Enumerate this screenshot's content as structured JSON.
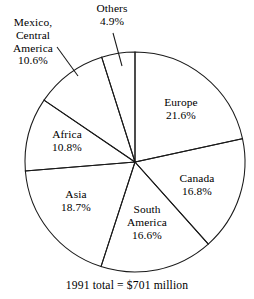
{
  "chart_data": {
    "type": "pie",
    "title": "",
    "subtitle": "",
    "caption": "1991 total = $701 million",
    "total_label": "1991 total",
    "total_value": "$701 million",
    "year": "1991",
    "units": "percent of total",
    "start_angle_deg": 0,
    "direction": "clockwise",
    "legend": "none (direct labels)",
    "grid": false,
    "categories": [
      "Europe",
      "Canada",
      "South America",
      "Asia",
      "Africa",
      "Mexico, Central America",
      "Others"
    ],
    "values": [
      21.6,
      16.8,
      16.6,
      18.7,
      10.8,
      10.6,
      4.9
    ],
    "slices": [
      {
        "id": "europe",
        "name": "Europe",
        "name_lines": [
          "Europe"
        ],
        "percent": 21.6,
        "percent_label": "21.6%",
        "label_placement": "inside",
        "color": "#ffffff",
        "stroke": "#1a1a1a"
      },
      {
        "id": "canada",
        "name": "Canada",
        "name_lines": [
          "Canada"
        ],
        "percent": 16.8,
        "percent_label": "16.8%",
        "label_placement": "inside",
        "color": "#ffffff",
        "stroke": "#1a1a1a"
      },
      {
        "id": "south-america",
        "name": "South America",
        "name_lines": [
          "South",
          "America"
        ],
        "percent": 16.6,
        "percent_label": "16.6%",
        "label_placement": "inside",
        "color": "#ffffff",
        "stroke": "#1a1a1a"
      },
      {
        "id": "asia",
        "name": "Asia",
        "name_lines": [
          "Asia"
        ],
        "percent": 18.7,
        "percent_label": "18.7%",
        "label_placement": "inside",
        "color": "#ffffff",
        "stroke": "#1a1a1a"
      },
      {
        "id": "africa",
        "name": "Africa",
        "name_lines": [
          "Africa"
        ],
        "percent": 10.8,
        "percent_label": "10.8%",
        "label_placement": "inside",
        "color": "#ffffff",
        "stroke": "#1a1a1a"
      },
      {
        "id": "mexico-central-america",
        "name": "Mexico, Central America",
        "name_lines": [
          "Mexico,",
          "Central",
          "America"
        ],
        "percent": 10.6,
        "percent_label": "10.6%",
        "label_placement": "outside-leader",
        "color": "#ffffff",
        "stroke": "#1a1a1a"
      },
      {
        "id": "others",
        "name": "Others",
        "name_lines": [
          "Others"
        ],
        "percent": 4.9,
        "percent_label": "4.9%",
        "label_placement": "outside-leader",
        "color": "#ffffff",
        "stroke": "#1a1a1a"
      }
    ]
  },
  "figure": {
    "background": "#ffffff",
    "line_color": "#1a1a1a",
    "center_x": 135,
    "center_y": 162,
    "radius": 110
  }
}
